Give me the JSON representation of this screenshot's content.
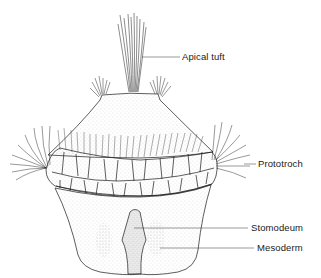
{
  "figure": {
    "labels": {
      "apical_tuft": "Apical tuft",
      "prototroch": "Prototroch",
      "stomodeum": "Stomodeum",
      "mesoderm": "Mesoderm"
    },
    "colors": {
      "line": "#1a1a1a",
      "stipple": "#555555",
      "background": "#ffffff"
    }
  }
}
